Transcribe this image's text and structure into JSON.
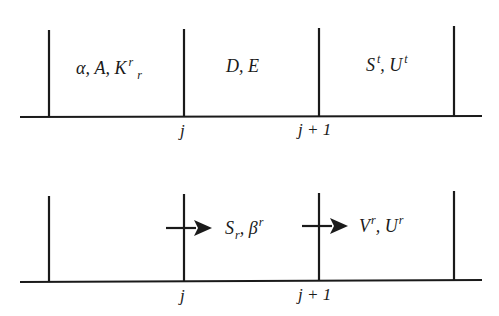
{
  "diagram": {
    "colors": {
      "line": "#1a1a1a",
      "background": "#ffffff"
    },
    "top_panel": {
      "cells": [
        {
          "main": "α, A, K",
          "sup": "r",
          "sub": "r"
        },
        {
          "main": "D, E"
        },
        {
          "parts": [
            {
              "base": "S",
              "sup": "t"
            },
            {
              "sep": ", "
            },
            {
              "base": "U",
              "sup": "t"
            }
          ]
        }
      ],
      "cell_0_text": "α, A, K",
      "cell_0_sup": "r",
      "cell_0_sub": "r",
      "cell_1_text": "D, E",
      "cell_2_base1": "S",
      "cell_2_sup1": "t",
      "cell_2_sep": ", ",
      "cell_2_base2": "U",
      "cell_2_sup2": "t",
      "tick_labels": [
        "j",
        "j + 1"
      ]
    },
    "bottom_panel": {
      "flux_0_base": "S",
      "flux_0_sub": "r",
      "flux_0_sep": ", β",
      "flux_0_sup": "r",
      "flux_1_base1": "V",
      "flux_1_sup1": "r",
      "flux_1_sep": ", U",
      "flux_1_sup2": "r",
      "arrows": [
        "arrow at j",
        "arrow at j + 1"
      ],
      "tick_labels": [
        "j",
        "j + 1"
      ]
    }
  }
}
